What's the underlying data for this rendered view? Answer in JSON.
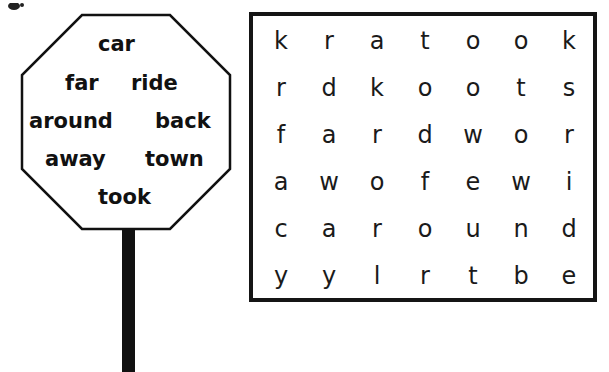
{
  "sign": {
    "shape": "octagon",
    "words": [
      {
        "text": "car",
        "x": 78,
        "y": 21
      },
      {
        "text": "far",
        "x": 45,
        "y": 60
      },
      {
        "text": "ride",
        "x": 111,
        "y": 60
      },
      {
        "text": "around",
        "x": 9,
        "y": 98
      },
      {
        "text": "back",
        "x": 135,
        "y": 98
      },
      {
        "text": "away",
        "x": 25,
        "y": 136
      },
      {
        "text": "town",
        "x": 125,
        "y": 136
      },
      {
        "text": "took",
        "x": 78,
        "y": 174
      }
    ]
  },
  "grid": {
    "rows": [
      [
        "k",
        "r",
        "a",
        "t",
        "o",
        "o",
        "k"
      ],
      [
        "r",
        "d",
        "k",
        "o",
        "o",
        "t",
        "s"
      ],
      [
        "f",
        "a",
        "r",
        "d",
        "w",
        "o",
        "r"
      ],
      [
        "a",
        "w",
        "o",
        "f",
        "e",
        "w",
        "i"
      ],
      [
        "c",
        "a",
        "r",
        "o",
        "u",
        "n",
        "d"
      ],
      [
        "y",
        "y",
        "l",
        "r",
        "t",
        "b",
        "e"
      ]
    ]
  },
  "colors": {
    "ink": "#111111",
    "background": "#ffffff"
  }
}
